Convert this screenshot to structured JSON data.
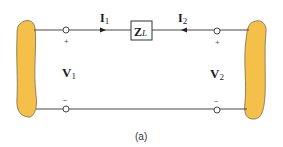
{
  "diagram": {
    "colors": {
      "network_fill": "#f4c04a",
      "network_stroke": "#7a6a4a",
      "wire": "#333333"
    },
    "left_port": {
      "voltage_label": "V",
      "voltage_subscript": "1",
      "plus": "+",
      "minus": "−",
      "current_label": "I",
      "current_subscript": "1"
    },
    "right_port": {
      "voltage_label": "V",
      "voltage_subscript": "2",
      "plus": "+",
      "minus": "−",
      "current_label": "I",
      "current_subscript": "2"
    },
    "impedance": {
      "label": "Z",
      "subscript": "L"
    },
    "caption": "(a)"
  }
}
